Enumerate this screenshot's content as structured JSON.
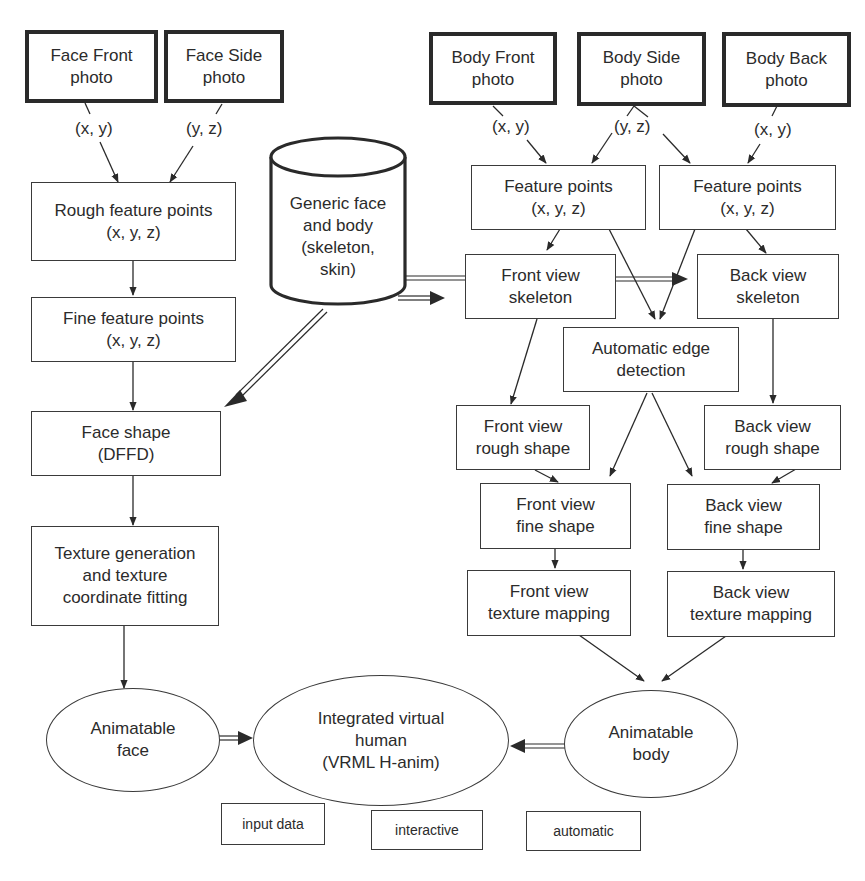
{
  "diagram": {
    "inputs": {
      "face_front": [
        "Face Front",
        "photo"
      ],
      "face_side": [
        "Face Side",
        "photo"
      ],
      "body_front": [
        "Body Front",
        "photo"
      ],
      "body_side": [
        "Body Side",
        "photo"
      ],
      "body_back": [
        "Body Back",
        "photo"
      ]
    },
    "edge_labels": {
      "face_front_xy": "(x, y)",
      "face_side_yz": "(y, z)",
      "body_front_xy": "(x, y)",
      "body_side_yz": "(y, z)",
      "body_back_xy": "(x, y)"
    },
    "database": [
      "Generic face",
      "and body",
      "(skeleton,",
      "skin)"
    ],
    "face_pipeline": {
      "rough_points": [
        "Rough feature points",
        "(x, y, z)"
      ],
      "fine_points": [
        "Fine feature points",
        "(x, y, z)"
      ],
      "face_shape": [
        "Face shape",
        "(DFFD)"
      ],
      "texture_gen": [
        "Texture generation",
        "and texture",
        "coordinate fitting"
      ],
      "animatable_face": [
        "Animatable",
        "face"
      ]
    },
    "body_pipeline": {
      "front_feature_points": [
        "Feature points",
        "(x, y, z)"
      ],
      "back_feature_points": [
        "Feature points",
        "(x, y, z)"
      ],
      "front_skeleton": [
        "Front view",
        "skeleton"
      ],
      "back_skeleton": [
        "Back view",
        "skeleton"
      ],
      "edge_detection": [
        "Automatic edge",
        "detection"
      ],
      "front_rough": [
        "Front view",
        "rough shape"
      ],
      "back_rough": [
        "Back view",
        "rough shape"
      ],
      "front_fine": [
        "Front view",
        "fine shape"
      ],
      "back_fine": [
        "Back view",
        "fine shape"
      ],
      "front_texture": [
        "Front view",
        "texture mapping"
      ],
      "back_texture": [
        "Back view",
        "texture mapping"
      ],
      "animatable_body": [
        "Animatable",
        "body"
      ]
    },
    "integrated": [
      "Integrated virtual",
      "human",
      "(VRML H-anim)"
    ],
    "legend": {
      "input": "input data",
      "interactive": "interactive",
      "automatic": "automatic"
    },
    "colors": {
      "stroke": "#2a2a2a",
      "background": "#ffffff",
      "text": "#2b2b2b"
    }
  }
}
